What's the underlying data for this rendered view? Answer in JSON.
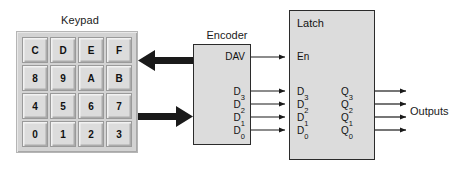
{
  "diagram": {
    "colors": {
      "block_fill": "#dcdcdc",
      "block_stroke": "#2b2b2b",
      "key_fill": "#dcdcdc",
      "keypad_frame_fill": "#d3d3d3",
      "wire": "#1a1a1a",
      "text": "#111111",
      "background": "#ffffff"
    }
  },
  "keypad": {
    "label": "Keypad",
    "rows": [
      [
        "C",
        "D",
        "E",
        "F"
      ],
      [
        "8",
        "9",
        "A",
        "B"
      ],
      [
        "4",
        "5",
        "6",
        "7"
      ],
      [
        "0",
        "1",
        "2",
        "3"
      ]
    ],
    "keys_flat": [
      "C",
      "D",
      "E",
      "F",
      "8",
      "9",
      "A",
      "B",
      "4",
      "5",
      "6",
      "7",
      "0",
      "1",
      "2",
      "3"
    ],
    "grid": "4x4"
  },
  "encoder": {
    "label": "Encoder",
    "pins": {
      "dav": "DAV",
      "data": [
        {
          "base": "D",
          "sub": "3"
        },
        {
          "base": "D",
          "sub": "2"
        },
        {
          "base": "D",
          "sub": "1"
        },
        {
          "base": "D",
          "sub": "0"
        }
      ]
    }
  },
  "latch": {
    "label": "Latch",
    "enable": "En",
    "inputs": [
      {
        "base": "D",
        "sub": "3"
      },
      {
        "base": "D",
        "sub": "2"
      },
      {
        "base": "D",
        "sub": "1"
      },
      {
        "base": "D",
        "sub": "0"
      }
    ],
    "outputs": [
      {
        "base": "Q",
        "sub": "3"
      },
      {
        "base": "Q",
        "sub": "2"
      },
      {
        "base": "Q",
        "sub": "1"
      },
      {
        "base": "Q",
        "sub": "0"
      }
    ]
  },
  "outputs": {
    "label": "Outputs",
    "count": 4
  },
  "buses": {
    "scan_out": {
      "direction": "left",
      "from": "encoder",
      "to": "keypad",
      "style": "thick-arrow"
    },
    "scan_in": {
      "direction": "right",
      "from": "keypad",
      "to": "encoder",
      "style": "thick-arrow"
    }
  },
  "signals": [
    {
      "name": "DAV-to-En",
      "from": "encoder.DAV",
      "to": "latch.En"
    },
    {
      "name": "D3",
      "from": "encoder.D3",
      "to": "latch.D3"
    },
    {
      "name": "D2",
      "from": "encoder.D2",
      "to": "latch.D2"
    },
    {
      "name": "D1",
      "from": "encoder.D1",
      "to": "latch.D1"
    },
    {
      "name": "D0",
      "from": "encoder.D0",
      "to": "latch.D0"
    }
  ]
}
